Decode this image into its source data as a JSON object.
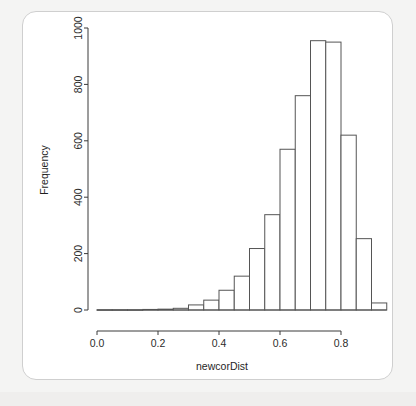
{
  "figure": {
    "background_color": "#f4f4f3",
    "card_color": "#ffffff",
    "bar_stroke_color": "#555555",
    "bar_fill_color": "#ffffff",
    "axis_color": "#3a3a3a"
  },
  "chart_data": {
    "type": "bar",
    "title": "",
    "subtitle": "",
    "xlabel": "newcorDist",
    "ylabel": "Frequency",
    "grid": false,
    "legend": null,
    "legend_position": "none",
    "xlim": [
      0.0,
      0.95
    ],
    "ylim": [
      0,
      1000
    ],
    "xticks": [
      "0.0",
      "0.2",
      "0.4",
      "0.6",
      "0.8"
    ],
    "xtick_values": [
      0.0,
      0.2,
      0.4,
      0.6,
      0.8
    ],
    "yticks": [
      "0",
      "200",
      "400",
      "600",
      "800",
      "1000"
    ],
    "ytick_values": [
      0,
      200,
      400,
      600,
      800,
      1000
    ],
    "bin_width": 0.05,
    "bin_starts": [
      0.0,
      0.05,
      0.1,
      0.15,
      0.2,
      0.25,
      0.3,
      0.35,
      0.4,
      0.45,
      0.5,
      0.55,
      0.6,
      0.65,
      0.7,
      0.75,
      0.8,
      0.85,
      0.9
    ],
    "bin_labels": [
      "0.00-0.05",
      "0.05-0.10",
      "0.10-0.15",
      "0.15-0.20",
      "0.20-0.25",
      "0.25-0.30",
      "0.30-0.35",
      "0.35-0.40",
      "0.40-0.45",
      "0.45-0.50",
      "0.50-0.55",
      "0.55-0.60",
      "0.60-0.65",
      "0.65-0.70",
      "0.70-0.75",
      "0.75-0.80",
      "0.80-0.85",
      "0.85-0.90",
      "0.90-0.95"
    ],
    "values": [
      1,
      1,
      1,
      2,
      3,
      6,
      18,
      35,
      70,
      120,
      218,
      338,
      570,
      760,
      955,
      950,
      620,
      253,
      25
    ]
  },
  "axis": {
    "y_label": "Frequency",
    "x_label": "newcorDist"
  }
}
